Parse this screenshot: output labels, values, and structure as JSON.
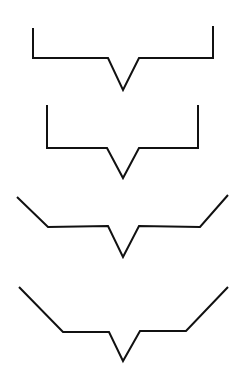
{
  "canvas": {
    "width": 243,
    "height": 390,
    "background": "#ffffff"
  },
  "style": {
    "stroke_color": "#111111",
    "stroke_width": 2
  },
  "shapes": [
    {
      "name": "bracket-shape-1",
      "description": "squared bracket with downward V notch, wide",
      "points": "33,28 33,58 108,58 123,90 139,58 213,58 213,26"
    },
    {
      "name": "bracket-shape-2",
      "description": "squared bracket with downward V notch, narrower",
      "points": "47,105 47,148 107,148 123,178 139,148 198,148 198,105"
    },
    {
      "name": "bracket-shape-3",
      "description": "angled bracket with downward V notch, short slopes",
      "points": "17,197 48,227 108,226 123,257 139,226 200,227 228,195"
    },
    {
      "name": "bracket-shape-4",
      "description": "angled bracket with downward V notch, long slopes",
      "points": "19,287 63,332 109,332 123,361 140,331 186,331 228,287"
    }
  ]
}
